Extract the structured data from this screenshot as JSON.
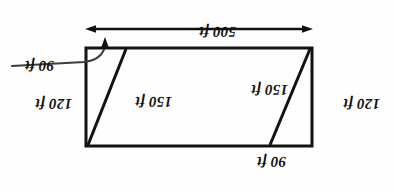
{
  "figure": {
    "kind": "geometry-diagram",
    "orientation": "rotated-180",
    "background_color": "#fefefe",
    "ink_color": "#121212",
    "shape": "rectangle-with-two-internal-diagonals",
    "labels": {
      "top_90": "90 ft",
      "left_120": "120 ft",
      "inner_150_left": "150 ft",
      "inner_150_right": "150 ft",
      "right_120": "120 ft",
      "lower_right_90": "90 ft",
      "bottom_500": "500 ft"
    },
    "geometry": {
      "rect": {
        "x": 82,
        "y": 46,
        "width": 226,
        "height": 98
      },
      "diagonal_left": {
        "x1": 124,
        "y1": 46,
        "x2": 83,
        "y2": 144
      },
      "diagonal_right": {
        "x1": 307,
        "y1": 46,
        "x2": 268,
        "y2": 144
      },
      "dimension_line": {
        "x1": 82,
        "y1": 163,
        "x2": 307,
        "y2": 163
      },
      "leader": {
        "from_x": 380,
        "from_y": 126,
        "to_x": 288,
        "to_y": 137
      }
    },
    "measurements": {
      "rectangle_length_ft": 500,
      "rectangle_width_ft": 120,
      "diagonal_ft": 150,
      "offset_ft": 90
    }
  }
}
